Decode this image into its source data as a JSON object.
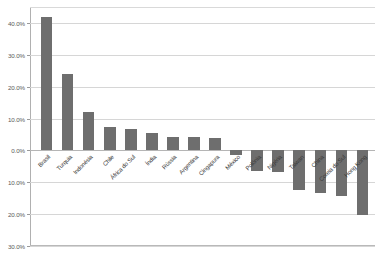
{
  "title_strip": "",
  "chart_data": {
    "type": "bar",
    "title": "",
    "subtitle": "",
    "xlabel": "",
    "ylabel": "",
    "ylim": [
      -30,
      45
    ],
    "grid": true,
    "legend": false,
    "legend_position": "none",
    "bar_color": "#6e6e6e",
    "gridline_color": "#d6d6d6",
    "axis_color": "#b0b0b0",
    "background_color": "#ffffff",
    "label_rotation_deg": -45,
    "value_format": "percent",
    "ytick_labels": [
      "40.0%",
      "30.0%",
      "20.0%",
      "10.0%",
      "0.0%",
      "10.0%",
      "20.0%",
      "30.0%"
    ],
    "ytick_values": [
      40,
      30,
      20,
      10,
      0,
      -10,
      -20,
      -30
    ],
    "categories": [
      "Brasil",
      "Turquia",
      "Indonésia",
      "Chile",
      "África do Sul",
      "Índia",
      "Rússia",
      "Argentina",
      "Cingapura",
      "México",
      "Polônia",
      "Nigéria",
      "Taiwan",
      "China",
      "Coreia do Sul",
      "Hong Kong"
    ],
    "values": [
      41.8,
      23.9,
      12.2,
      7.5,
      6.8,
      5.6,
      4.3,
      4.1,
      3.8,
      -1.3,
      -6.5,
      -6.8,
      -12.4,
      -13.3,
      -14.2,
      -20.2
    ]
  }
}
